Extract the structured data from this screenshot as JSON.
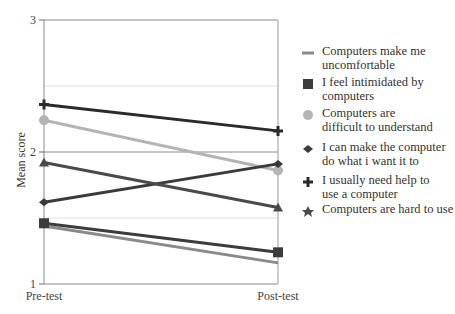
{
  "chart_data": {
    "type": "line",
    "title": "",
    "xlabel": "",
    "ylabel": "Mean score",
    "categories": [
      "Pre-test",
      "Post-test"
    ],
    "ylim": [
      1,
      3
    ],
    "yticks": [
      "1",
      "2",
      "3"
    ],
    "major_gridlines": [
      1,
      2,
      3
    ],
    "minor_gridlines": [
      1.5,
      2.5
    ],
    "legend_position": "right",
    "series": [
      {
        "name": "Computers make me uncomfortable",
        "label_lines": [
          "Computers make me",
          "uncomfortable"
        ],
        "values": [
          1.44,
          1.16
        ],
        "marker": "dash",
        "color": "#8a8a8a"
      },
      {
        "name": "I feel intimidated by computers",
        "label_lines": [
          "I feel intimidated by",
          "computers"
        ],
        "values": [
          1.46,
          1.24
        ],
        "marker": "square",
        "color": "#3c3c3c"
      },
      {
        "name": "Computers are difficult to understand",
        "label_lines": [
          "Computers are",
          "difficult to understand"
        ],
        "values": [
          2.24,
          1.86
        ],
        "marker": "circle",
        "color": "#b4b4b4"
      },
      {
        "name": "I can make the computer do what i want it to",
        "label_lines": [
          "I can make the computer",
          "do what i want it to"
        ],
        "values": [
          1.62,
          1.91
        ],
        "marker": "diamond",
        "color": "#3a3a3a"
      },
      {
        "name": "I usually need help to use a computer",
        "label_lines": [
          "I usually need help to",
          "use a computer"
        ],
        "values": [
          2.36,
          2.16
        ],
        "marker": "cross",
        "color": "#2a2a2a"
      },
      {
        "name": "Computers are hard to use",
        "label_lines": [
          "Computers are hard to use"
        ],
        "values": [
          1.92,
          1.58
        ],
        "marker": "triangle",
        "color": "#4a4a4a"
      }
    ]
  }
}
